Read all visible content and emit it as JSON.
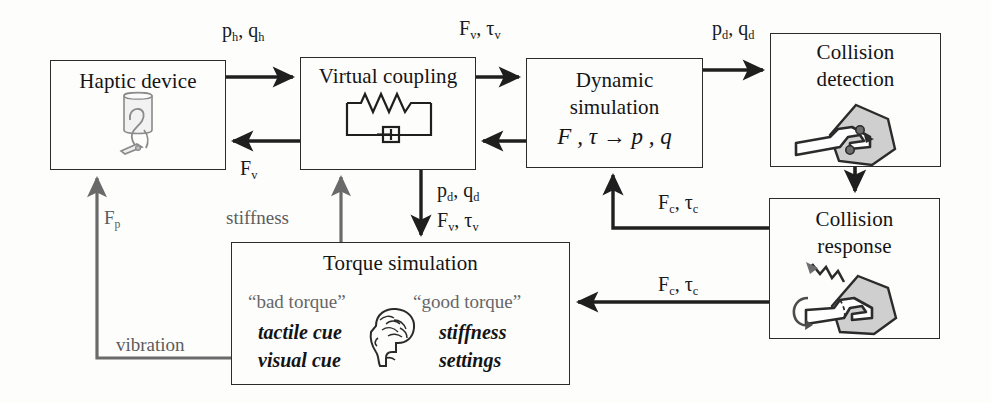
{
  "diagram": {
    "canvas": {
      "width": 991,
      "height": 403
    },
    "colors": {
      "stroke_black": "#2b2b2b",
      "stroke_gray": "#6a6a6a",
      "text_black": "#141414",
      "text_gray": "#5c5c5c",
      "fill_gray": "#c9c9c9",
      "background": "#fdfdfc"
    },
    "nodes": [
      {
        "id": "haptic-device",
        "label": "Haptic device",
        "icon": "haptic-stylus-icon",
        "x": 50,
        "y": 60,
        "w": 176,
        "h": 110
      },
      {
        "id": "virtual-coupling",
        "label": "Virtual coupling",
        "icon": "spring-damper-icon",
        "x": 300,
        "y": 57,
        "w": 176,
        "h": 113
      },
      {
        "id": "dynamic-simulation",
        "label_line1": "Dynamic",
        "label_line2": "simulation",
        "equation": "F , τ → p , q",
        "x": 526,
        "y": 58,
        "w": 177,
        "h": 110
      },
      {
        "id": "collision-detection",
        "label_line1": "Collision",
        "label_line2": "detection",
        "icon": "tool-polygon-collision-icon",
        "x": 770,
        "y": 33,
        "w": 171,
        "h": 134
      },
      {
        "id": "collision-response",
        "label_line1": "Collision",
        "label_line2": "response",
        "icon": "tool-polygon-response-icon",
        "x": 769,
        "y": 198,
        "w": 171,
        "h": 141
      },
      {
        "id": "torque-simulation",
        "label": "Torque simulation",
        "icon": "brain-head-icon",
        "x": 231,
        "y": 242,
        "w": 339,
        "h": 143,
        "bad_torque_quote": "“bad torque”",
        "good_torque_quote": "“good torque”",
        "bad_cue_line1": "tactile cue",
        "bad_cue_line2": "visual cue",
        "good_cue_line1": "stiffness",
        "good_cue_line2": "settings"
      }
    ],
    "edges": [
      {
        "id": "haptic-to-coupling",
        "label_base": "p",
        "label_sub1": "h",
        "label_base2": "q",
        "label_sub2": "h",
        "label_text": "p h , q h",
        "style": "black",
        "from": "haptic-device",
        "to": "virtual-coupling"
      },
      {
        "id": "coupling-to-haptic",
        "label_text": "F v",
        "style": "black",
        "from": "virtual-coupling",
        "to": "haptic-device"
      },
      {
        "id": "coupling-to-dynamic",
        "label_text": "F v , τ v",
        "style": "black",
        "from": "virtual-coupling",
        "to": "dynamic-simulation"
      },
      {
        "id": "dynamic-to-coupling",
        "label_text": "p d , q d",
        "style": "black",
        "from": "dynamic-simulation",
        "to": "virtual-coupling"
      },
      {
        "id": "dynamic-to-detection",
        "label_text": "p d , q d",
        "style": "black",
        "from": "dynamic-simulation",
        "to": "collision-detection"
      },
      {
        "id": "detection-to-response",
        "label_text": "",
        "style": "black",
        "from": "collision-detection",
        "to": "collision-response"
      },
      {
        "id": "response-to-dynamic",
        "label_text": "F c , τ c",
        "style": "black",
        "from": "collision-response",
        "to": "dynamic-simulation"
      },
      {
        "id": "response-to-torque",
        "label_text": "F c , τ c",
        "style": "black",
        "from": "collision-response",
        "to": "torque-simulation"
      },
      {
        "id": "coupling-to-torque",
        "label_text": "F v , τ v",
        "style": "black",
        "from": "virtual-coupling",
        "to": "torque-simulation"
      },
      {
        "id": "torque-to-coupling-stiffness",
        "label_text": "stiffness",
        "style": "gray",
        "from": "torque-simulation",
        "to": "virtual-coupling"
      },
      {
        "id": "torque-to-haptic-vibration",
        "label_text": "vibration",
        "label_text2": "F p",
        "style": "gray",
        "from": "torque-simulation",
        "to": "haptic-device"
      }
    ],
    "labels": {
      "ph_qh": {
        "main1": "p",
        "sub1": "h",
        "main2": "q",
        "sub2": "h",
        "x": 222,
        "y": 25
      },
      "fv_tauv_top": {
        "main1": "F",
        "sub1": "v",
        "main2": "τ",
        "sub2": "v",
        "x": 459,
        "y": 22
      },
      "pd_qd_top": {
        "main1": "p",
        "sub1": "d",
        "main2": "q",
        "sub2": "d",
        "x": 717,
        "y": 22
      },
      "fv_back": {
        "main1": "F",
        "sub1": "v",
        "x": 242,
        "y": 161
      },
      "pd_qd_mid": {
        "main1": "p",
        "sub1": "d",
        "main2": "q",
        "sub2": "d",
        "x": 440,
        "y": 183
      },
      "fv_tauv_down": {
        "main1": "F",
        "sub1": "v",
        "main2": "τ",
        "sub2": "v",
        "x": 440,
        "y": 213
      },
      "fc_tauc_up": {
        "main1": "F",
        "sub1": "c",
        "main2": "τ",
        "sub2": "c",
        "x": 661,
        "y": 194
      },
      "fc_tauc_left": {
        "main1": "F",
        "sub1": "c",
        "main2": "τ",
        "sub2": "c",
        "x": 661,
        "y": 277
      },
      "stiffness": {
        "text": "stiffness",
        "x": 229,
        "y": 211
      },
      "vibration": {
        "text": "vibration",
        "x": 118,
        "y": 338
      },
      "fp": {
        "main1": "F",
        "sub1": "p",
        "x": 106,
        "y": 212
      }
    }
  }
}
